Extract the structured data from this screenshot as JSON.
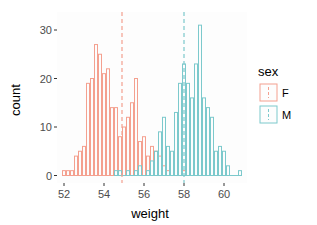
{
  "chart_data": {
    "type": "bar",
    "subtype": "overlaid histogram",
    "title": "",
    "xlabel": "weight",
    "ylabel": "count",
    "xlim": [
      51.6,
      61.1
    ],
    "ylim": [
      0,
      32
    ],
    "x_ticks": [
      52,
      54,
      56,
      58,
      60
    ],
    "y_ticks": [
      0,
      10,
      20,
      30
    ],
    "bin_width": 0.2,
    "grid": false,
    "legend": {
      "title": "sex",
      "position": "right",
      "entries": [
        "F",
        "M"
      ]
    },
    "series": [
      {
        "name": "F",
        "color": "#F8766D",
        "mean": 54.9,
        "bins": [
          52.0,
          52.2,
          52.4,
          52.6,
          52.8,
          53.0,
          53.2,
          53.4,
          53.6,
          53.8,
          54.0,
          54.2,
          54.4,
          54.6,
          54.8,
          55.0,
          55.2,
          55.4,
          55.6,
          55.8,
          56.0,
          56.2,
          56.4,
          56.6,
          56.8,
          57.0,
          57.2,
          57.4,
          57.6,
          57.8,
          58.0
        ],
        "values": [
          1,
          1,
          1,
          4,
          5,
          6,
          19,
          20,
          27,
          25,
          21,
          22,
          14,
          14,
          8,
          10,
          12,
          15,
          20,
          7,
          8,
          4,
          6,
          5,
          4,
          2,
          1,
          0,
          0,
          0,
          1
        ]
      },
      {
        "name": "M",
        "color": "#00BFC4",
        "mean": 58.0,
        "bins": [
          54.6,
          54.8,
          55.0,
          55.2,
          55.4,
          55.6,
          55.8,
          56.0,
          56.2,
          56.4,
          56.6,
          56.8,
          57.0,
          57.2,
          57.4,
          57.6,
          57.8,
          58.0,
          58.2,
          58.4,
          58.6,
          58.8,
          59.0,
          59.2,
          59.4,
          59.6,
          59.8,
          60.0,
          60.2,
          60.4,
          60.6,
          60.8
        ],
        "values": [
          1,
          1,
          0,
          1,
          0,
          1,
          2,
          0,
          1,
          3,
          5,
          9,
          12,
          6,
          5,
          13,
          19,
          23,
          19,
          16,
          23,
          31,
          16,
          14,
          12,
          5,
          6,
          5,
          2,
          0,
          0,
          1
        ]
      }
    ]
  }
}
